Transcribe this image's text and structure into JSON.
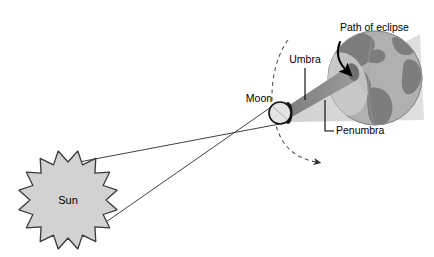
{
  "diagram": {
    "background_color": "#ffffff",
    "width": 434,
    "height": 257,
    "labels": {
      "path_of_eclipse": "Path of eclipse",
      "umbra": "Umbra",
      "penumbra": "Penumbra",
      "moon": "Moon",
      "sun": "Sun"
    },
    "colors": {
      "sun_fill": "#d2d2d2",
      "sun_stroke": "#3a3a3a",
      "moon_fill": "#e2e2e2",
      "moon_stroke": "#1a1a1a",
      "moon_shadow_cap": "#111111",
      "earth_ocean": "#b0b0b0",
      "earth_land": "#7d7d7d",
      "earth_stroke": "#8a8a8a",
      "umbra_cone": "#8c8c8c",
      "penumbra_cone": "#d8d8d8",
      "ray_line": "#2b2b2b",
      "orbit_dash": "#555555",
      "eclipse_path_arrow": "#000000",
      "text": "#000000"
    },
    "bodies": {
      "sun": {
        "cx": 68,
        "cy": 200,
        "outer_r": 50,
        "inner_r": 38,
        "points": 16
      },
      "moon": {
        "cx": 281,
        "cy": 113,
        "r": 11
      },
      "earth": {
        "cx": 375,
        "cy": 78,
        "r": 47
      }
    },
    "annotations": {
      "umbra_leader": "vertical leader line from Umbra label down into the dark cone",
      "penumbra_leader": "elbow leader line from Penumbra label up into the light cone",
      "orbit": "dashed arc showing the Moon's orbital path with a direction arrowhead",
      "eclipse_track": "curved black arrow across the Earth's surface showing the eclipse track"
    }
  }
}
